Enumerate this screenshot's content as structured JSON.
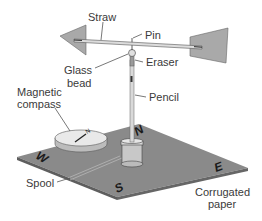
{
  "diagram": {
    "labels": {
      "straw": "Straw",
      "pin": "Pin",
      "glass_bead_line1": "Glass",
      "glass_bead_line2": "bead",
      "eraser": "Eraser",
      "magnetic_compass_line1": "Magnetic",
      "magnetic_compass_line2": "compass",
      "pencil": "Pencil",
      "spool": "Spool",
      "corrugated_paper_line1": "Corrugated",
      "corrugated_paper_line2": "paper"
    },
    "directions": {
      "north": "N",
      "south": "S",
      "east": "E",
      "west": "W"
    },
    "compass_marker": "N",
    "colors": {
      "paper": "#8a8a8a",
      "paper_edge": "#5e5e5e",
      "vane": "#a9a9a9",
      "compass_top": "#e9e9e9",
      "spool": "#c8c8c8"
    }
  }
}
